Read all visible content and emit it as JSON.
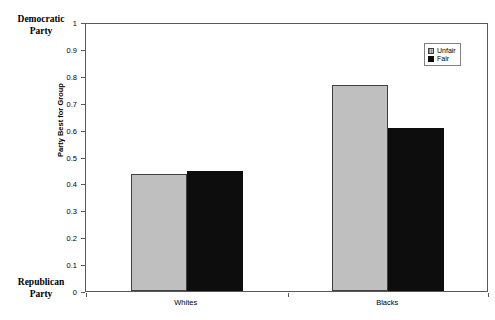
{
  "chart_data": {
    "type": "bar",
    "title": "",
    "xlabel": "",
    "ylabel": "Party Best for Group",
    "ylim": [
      0,
      1
    ],
    "ytick_labels": [
      "0",
      "0.1",
      "0.2",
      "0.3",
      "0.4",
      "0.5",
      "0.6",
      "0.7",
      "0.8",
      "0.9",
      "1"
    ],
    "ytick_values": [
      0,
      0.1,
      0.2,
      0.3,
      0.4,
      0.5,
      0.6,
      0.7,
      0.8,
      0.9,
      1
    ],
    "grid": false,
    "legend_position": "top-right",
    "categories": [
      "Whites",
      "Blacks"
    ],
    "series": [
      {
        "name": "Unfair",
        "color": "#bfbfbf",
        "values": [
          0.435,
          0.765
        ]
      },
      {
        "name": "Fair",
        "color": "#0d0d0d",
        "values": [
          0.445,
          0.605
        ]
      }
    ],
    "axis_anchor_high": "Democratic Party",
    "axis_anchor_low": "Republican Party"
  },
  "annotations": {
    "democratic_party_line1": "Democratic",
    "democratic_party_line2": "Party",
    "republican_party_line1": "Republican",
    "republican_party_line2": "Party"
  },
  "legend": {
    "items": [
      {
        "label": "Unfair"
      },
      {
        "label": "Fair"
      }
    ]
  },
  "colors": {
    "unfair_bar": "#bfbfbf",
    "fair_bar": "#0d0d0d",
    "axis": "#595959",
    "text": "#000000",
    "background": "#ffffff"
  }
}
